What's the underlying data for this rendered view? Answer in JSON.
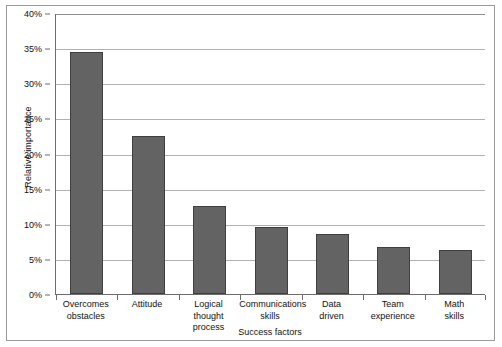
{
  "chart_data": {
    "type": "bar",
    "title": "",
    "xlabel": "Success factors",
    "ylabel": "Relative importance",
    "categories": [
      "Overcomes obstacles",
      "Attitude",
      "Logical thought process",
      "Communications skills",
      "Data driven",
      "Team experience",
      "Math skills"
    ],
    "category_lines": [
      [
        "Overcomes",
        "obstacles"
      ],
      [
        "Attitude",
        ""
      ],
      [
        "Logical",
        "thought process"
      ],
      [
        "Communications",
        "skills"
      ],
      [
        "Data",
        "driven"
      ],
      [
        "Team",
        "experience"
      ],
      [
        "Math",
        "skills"
      ]
    ],
    "values": [
      34.5,
      22.5,
      12.5,
      9.5,
      8.5,
      6.7,
      6.3
    ],
    "value_labels": [
      "34.5%",
      "22.5%",
      "12.5%",
      "9.5%",
      "8.5%",
      "6.7%",
      "6.3%"
    ],
    "ylim": [
      0,
      40
    ],
    "ytick_values": [
      0,
      5,
      10,
      15,
      20,
      25,
      30,
      35,
      40
    ],
    "ytick_labels": [
      "0%",
      "5%",
      "10%",
      "15%",
      "20%",
      "25%",
      "30%",
      "35%",
      "40%"
    ],
    "grid": true,
    "legend": false,
    "bar_color": "#636363",
    "bar_border_color": "#3f3f3f",
    "gridline_color": "#b2b2b2",
    "axis_color": "#6d6d6d",
    "background": "#ffffff"
  }
}
